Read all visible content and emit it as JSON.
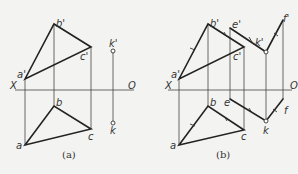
{
  "figure_a": {
    "caption": "(a)",
    "axis": {
      "left_label": "X",
      "right_label": "O"
    },
    "labels": {
      "a_prime": "a'",
      "b_prime": "b'",
      "c_prime": "c'",
      "k_prime": "k'",
      "a": "a",
      "b": "b",
      "c": "c",
      "k": "k"
    }
  },
  "figure_b": {
    "caption": "(b)",
    "axis": {
      "left_label": "X",
      "right_label": "O"
    },
    "labels": {
      "a_prime": "a'",
      "b_prime": "b'",
      "c_prime": "c'",
      "e_prime": "e'",
      "k_prime": "k'",
      "f_prime": "f'",
      "a": "a",
      "b": "b",
      "c": "c",
      "e": "e",
      "k": "k",
      "f": "f"
    }
  }
}
